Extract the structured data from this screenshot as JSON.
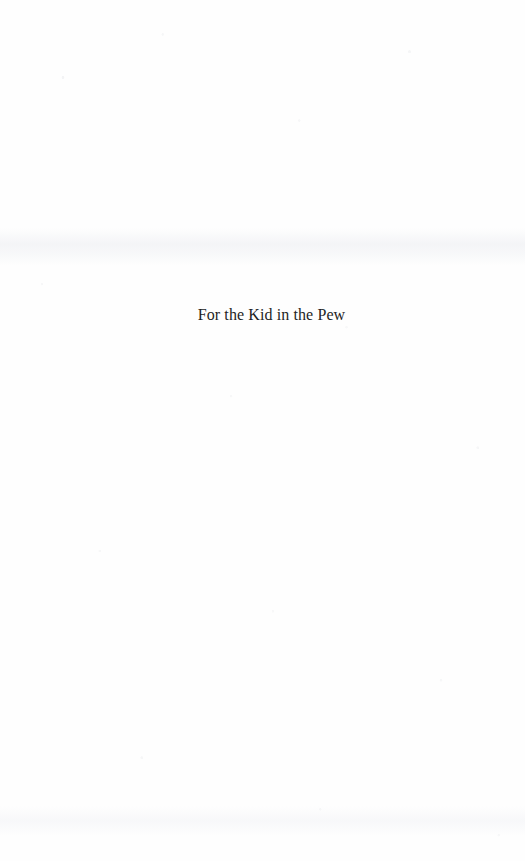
{
  "document": {
    "page_type": "dedication-page",
    "body_text": "For the Kid in the Pew"
  },
  "colors": {
    "page_background": "#fefefe",
    "text": "#1e1e1e",
    "paper_grain": "#cbced4",
    "bleed_through": "#f0f1f4"
  }
}
